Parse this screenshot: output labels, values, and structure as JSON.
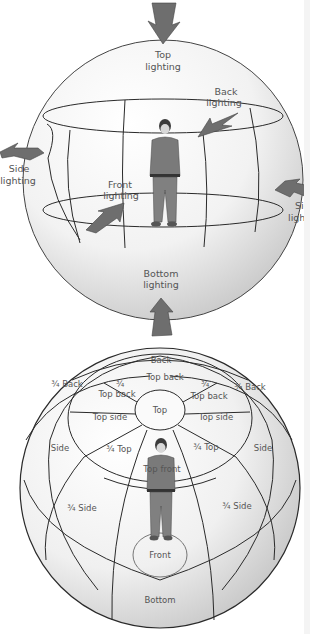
{
  "diagram": {
    "colors": {
      "background": "#ffffff",
      "sphere_light": "#fbfbfb",
      "sphere_shade": "#cfcfcf",
      "line": "#2a2a2a",
      "arrow": "#6e6e6e",
      "text": "#555555",
      "figure_body": "#7a7a7a"
    },
    "top_sphere": {
      "labels": {
        "top": [
          "Top",
          "lighting"
        ],
        "back": [
          "Back",
          "lighting"
        ],
        "side_left": [
          "Side",
          "lighting"
        ],
        "side_right": [
          "Side",
          "lighti"
        ],
        "front": [
          "Front",
          "lighting"
        ],
        "bottom": [
          "Bottom",
          "lighting"
        ]
      },
      "arrows": [
        "top-arrow",
        "back-arrow",
        "side-left-arrow",
        "side-right-arrow",
        "front-arrow",
        "bottom-arrow"
      ]
    },
    "bottom_sphere": {
      "regions": {
        "back": "Back",
        "top_back": "Top back",
        "three_quarter_back_left": "¾ Back",
        "three_quarter_back_right": "¾ Back",
        "three_quarter_top_back_left": [
          "¾",
          "Top back"
        ],
        "three_quarter_top_back_right": [
          "¾",
          "Top back"
        ],
        "top": "Top",
        "top_side_left": "Top side",
        "top_side_right": "Top side",
        "side_left": "Side",
        "side_right": "Side",
        "three_quarter_top_left": "¾ Top",
        "three_quarter_top_right": "¾ Top",
        "top_front": "Top front",
        "three_quarter_side_left": "¾ Side",
        "three_quarter_side_right": "¾ Side",
        "front": "Front",
        "bottom": "Bottom"
      }
    }
  }
}
